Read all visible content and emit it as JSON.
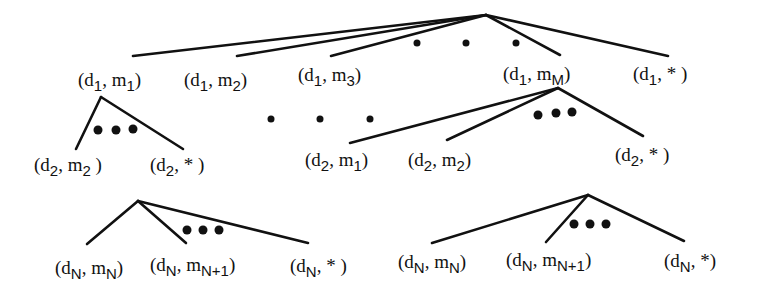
{
  "diagram": {
    "type": "tree",
    "colors": {
      "ink": "#111111",
      "background": "#ffffff"
    },
    "level1": {
      "root": [
        486,
        15
      ],
      "children": [
        {
          "d": "1",
          "m": "1",
          "label": "(d1, m1)"
        },
        {
          "d": "1",
          "m": "2",
          "label": "(d1, m2)"
        },
        {
          "d": "1",
          "m": "3",
          "label": "(d1, m3)"
        },
        {
          "d": "1",
          "m": "M",
          "label": "(d1, mM)"
        },
        {
          "d": "1",
          "m": "*",
          "label": "(d1, *)"
        }
      ],
      "ellipsis": "• • •"
    },
    "level2_left": {
      "parent": "(d1, m1)",
      "children": [
        {
          "d": "2",
          "m": "2",
          "label": "(d2, m2)"
        },
        {
          "d": "2",
          "m": "*",
          "label": "(d2, *)"
        }
      ],
      "ellipsis": "●●●"
    },
    "middle_ellipsis": "• • •",
    "level2_right": {
      "parent": "(d1, mM)",
      "children": [
        {
          "d": "2",
          "m": "1",
          "label": "(d2, m1)"
        },
        {
          "d": "2",
          "m": "2",
          "label": "(d2, m2)"
        },
        {
          "d": "2",
          "m": "*",
          "label": "(d2, *)"
        }
      ],
      "ellipsis": "●●●"
    },
    "levelN_left": {
      "children": [
        {
          "d": "N",
          "m": "N",
          "label": "(dN, mN)"
        },
        {
          "d": "N",
          "m": "N+1",
          "label": "(dN, mN+1)"
        },
        {
          "d": "N",
          "m": "*",
          "label": "(dN, *)"
        }
      ],
      "ellipsis": "●●●"
    },
    "levelN_right": {
      "children": [
        {
          "d": "N",
          "m": "N",
          "label": "(dN, mN)"
        },
        {
          "d": "N",
          "m": "N+1",
          "label": "(dN, mN+1)"
        },
        {
          "d": "N",
          "m": "*",
          "label": "(dN, *)"
        }
      ],
      "ellipsis": "●●●"
    },
    "symbols": {
      "d": "d",
      "m": "m",
      "open": "(",
      "close": ")",
      "comma": ","
    }
  }
}
